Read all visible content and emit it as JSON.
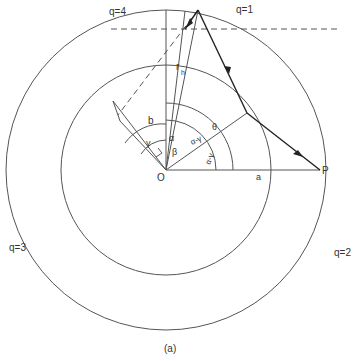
{
  "labels": {
    "q1": "q=1",
    "q2": "q=2",
    "q3": "q=3",
    "q4": "q=4",
    "rh": "r",
    "rh_sub": "h",
    "b": "b",
    "a": "a",
    "O": "O",
    "P": "P",
    "alpha": "α",
    "beta": "β",
    "gamma": "γ",
    "theta": "θ",
    "alpha_minus_gamma_1": "α-γ",
    "alpha_minus_gamma_2": "α-γ",
    "caption": "(a)"
  }
}
